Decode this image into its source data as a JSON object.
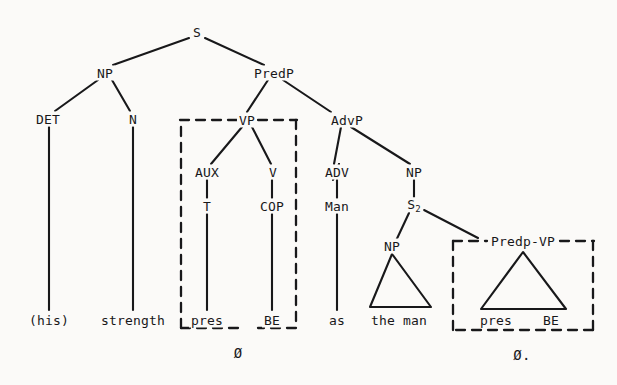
{
  "diagram": {
    "type": "constituency-tree",
    "background_color": "#fbfaf8",
    "ink_color": "#18181a",
    "sentence": "(his) strength as the man pres BE",
    "nodes": {
      "s": "S",
      "np_subject": "NP",
      "predp": "PredP",
      "det": "DET",
      "n": "N",
      "vp": "VP",
      "advp": "AdvP",
      "aux": "AUX",
      "v": "V",
      "adv": "ADV",
      "np_comparative": "NP",
      "t": "T",
      "cop": "COP",
      "man": "Man",
      "s2_label": "S",
      "s2_sub": "2",
      "np_theman": "NP",
      "predp_vp": "Predp-VP"
    },
    "terminals": {
      "his": "(his)",
      "strength": "strength",
      "pres_left": "pres",
      "be_left": "BE",
      "as": "as",
      "the_man": "the man",
      "pres_right": "pres",
      "be_right": "BE"
    },
    "annotations": {
      "empty_left": "Ø",
      "empty_right": "Ø."
    },
    "boxes": {
      "left_label": "VP",
      "right_label": "Predp-VP",
      "style": "dashed"
    },
    "triangles": {
      "the_man_label": "the man",
      "predp_vp_label": "pres BE"
    }
  }
}
